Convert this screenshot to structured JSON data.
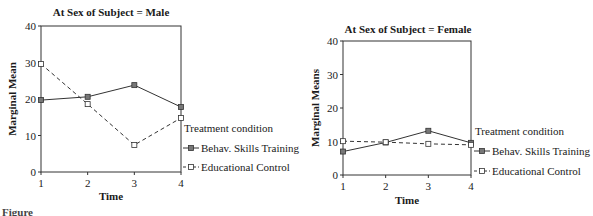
{
  "chart_data": [
    {
      "type": "line",
      "title": "At Sex of Subject = Male",
      "xlabel": "Time",
      "ylabel": "Marginal Mean",
      "categories": [
        "1",
        "2",
        "3",
        "4"
      ],
      "ylim": [
        0,
        40
      ],
      "yticks": [
        "0",
        "10",
        "20",
        "30",
        "40"
      ],
      "grid": false,
      "legend_title": "Treatment condition",
      "legend_position": "right",
      "series": [
        {
          "name": "Behav. Skills Training",
          "style": "solid",
          "values": [
            19.7,
            20.6,
            23.8,
            17.8
          ]
        },
        {
          "name": "Educational Control",
          "style": "dashed",
          "values": [
            29.6,
            18.6,
            7.4,
            14.8
          ]
        }
      ]
    },
    {
      "type": "line",
      "title": "At Sex of Subject = Female",
      "xlabel": "Time",
      "ylabel": "Marginal Means",
      "categories": [
        "1",
        "2",
        "3",
        "4"
      ],
      "ylim": [
        0,
        40
      ],
      "yticks": [
        "0",
        "10",
        "20",
        "30",
        "40"
      ],
      "grid": false,
      "legend_title": "Treatment condition",
      "legend_position": "right",
      "series": [
        {
          "name": "Behav. Skills Training",
          "style": "solid",
          "values": [
            7.0,
            9.7,
            13.2,
            9.6
          ]
        },
        {
          "name": "Educational Control",
          "style": "dashed",
          "values": [
            10.1,
            9.8,
            9.3,
            9.0
          ]
        }
      ]
    }
  ],
  "caption": "Figure"
}
